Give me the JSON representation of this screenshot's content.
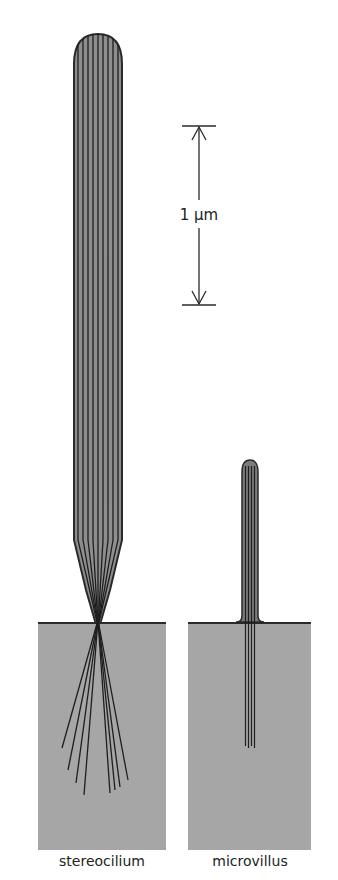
{
  "figure": {
    "scale_bar": {
      "label": "1 μm"
    },
    "labels": {
      "stereocilium": "stereocilium",
      "microvillus": "microvillus"
    },
    "caption_fragment": "1 .5  Comparison of the",
    "colors": {
      "tissue": "#a6a6a6",
      "process_fill": "#8e8e8e",
      "filament": "#1e1e1e",
      "outline": "#2a2a2a",
      "background": "#ffffff"
    }
  }
}
